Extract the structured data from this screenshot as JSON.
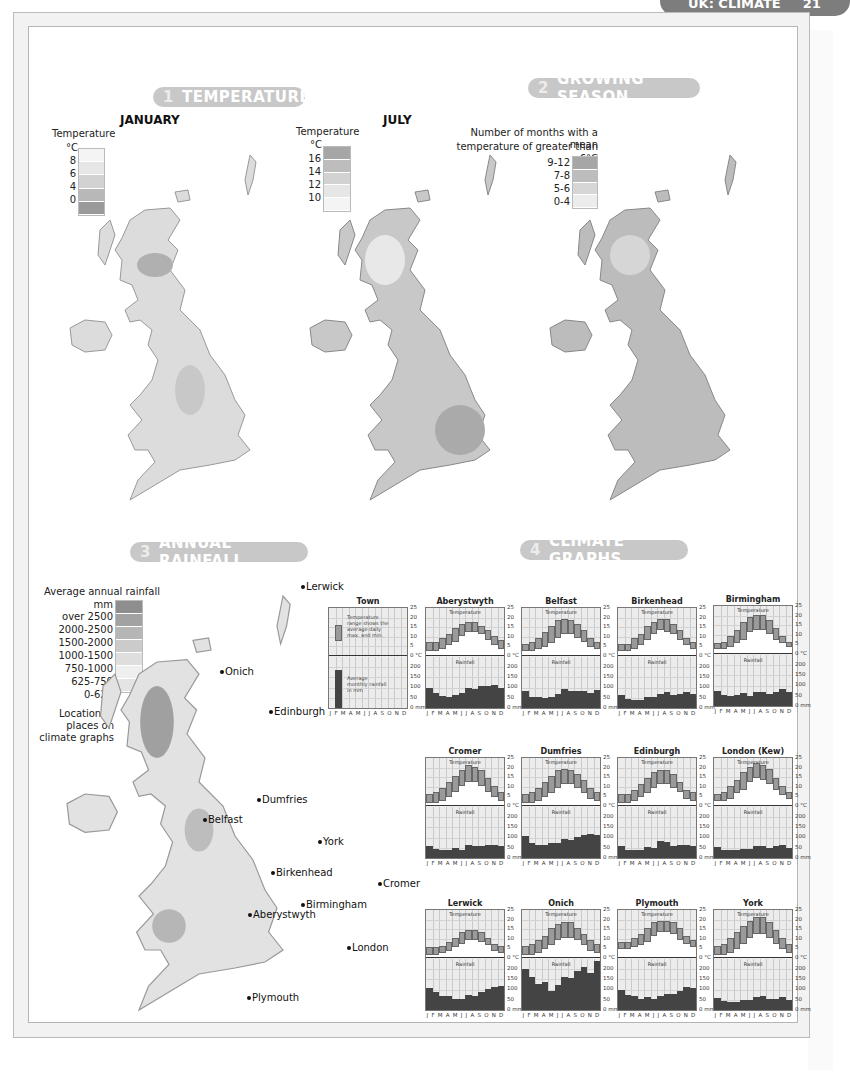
{
  "page_header": {
    "title": "UK: CLIMATE",
    "page_number": "21"
  },
  "sections": {
    "temperature": {
      "number": "1",
      "title": "TEMPERATURE"
    },
    "growing_season": {
      "number": "2",
      "title": "GROWING SEASON"
    },
    "annual_rainfall": {
      "number": "3",
      "title": "ANNUAL RAINFALL"
    },
    "climate_graphs": {
      "number": "4",
      "title": "CLIMATE GRAPHS"
    }
  },
  "january_map": {
    "title": "JANUARY",
    "legend": {
      "title": "Temperature",
      "unit": "°C",
      "ticks": [
        "8",
        "6",
        "4",
        "0"
      ],
      "colors": [
        "#f4f4f4",
        "#e6e6e6",
        "#d2d2d2",
        "#b8b8b8",
        "#9a9a9a"
      ]
    }
  },
  "july_map": {
    "title": "JULY",
    "legend": {
      "title": "Temperature",
      "unit": "°C",
      "ticks": [
        "16",
        "14",
        "12",
        "10"
      ],
      "colors": [
        "#a6a6a6",
        "#bdbdbd",
        "#d2d2d2",
        "#e6e6e6",
        "#f4f4f4"
      ]
    }
  },
  "growing_map": {
    "legend": {
      "title_line1": "Number of months with a mean",
      "title_line2": "temperature of greater than 6°C",
      "items": [
        "9-12",
        "7-8",
        "5-6",
        "0-4"
      ],
      "colors": [
        "#a6a6a6",
        "#bdbdbd",
        "#d6d6d6",
        "#ececec"
      ]
    }
  },
  "rainfall_map": {
    "legend": {
      "title": "Average annual rainfall",
      "unit": "mm",
      "items": [
        "over 2500",
        "2000-2500",
        "1500-2000",
        "1000-1500",
        "750-1000",
        "625-750",
        "0-625"
      ],
      "colors": [
        "#8e8e8e",
        "#a2a2a2",
        "#b6b6b6",
        "#cbcbcb",
        "#dedede",
        "#efefef",
        "#e4e4e4"
      ],
      "location_label_1": "Location of",
      "location_label_2": "places on",
      "location_label_3": "climate graphs"
    },
    "places": [
      {
        "name": "Lerwick",
        "x": 301,
        "y": 587
      },
      {
        "name": "Onich",
        "x": 220,
        "y": 672
      },
      {
        "name": "Edinburgh",
        "x": 269,
        "y": 712
      },
      {
        "name": "Dumfries",
        "x": 257,
        "y": 800
      },
      {
        "name": "Belfast",
        "x": 203,
        "y": 820
      },
      {
        "name": "York",
        "x": 318,
        "y": 842
      },
      {
        "name": "Birkenhead",
        "x": 271,
        "y": 873
      },
      {
        "name": "Cromer",
        "x": 378,
        "y": 884
      },
      {
        "name": "Birmingham",
        "x": 301,
        "y": 905
      },
      {
        "name": "Aberystwyth",
        "x": 248,
        "y": 915
      },
      {
        "name": "London",
        "x": 347,
        "y": 948
      },
      {
        "name": "Plymouth",
        "x": 247,
        "y": 998
      }
    ]
  },
  "climate_graphs": {
    "months": [
      "J",
      "F",
      "M",
      "A",
      "M",
      "J",
      "J",
      "A",
      "S",
      "O",
      "N",
      "D"
    ],
    "temp_axis": [
      "25",
      "20",
      "15",
      "10",
      "5",
      "0 °C"
    ],
    "rain_axis": [
      "200",
      "150",
      "100",
      "50",
      "0 mm"
    ],
    "temperature_label": "Temperature",
    "rainfall_label": "Rainfall",
    "key": {
      "title": "Town",
      "temp_text": "Temperature range shows the average daily max. and min.",
      "rain_text": "Average monthly rainfall in mm"
    }
  },
  "chart_data": [
    {
      "type": "bar",
      "title": "Aberystwyth",
      "categories": [
        "J",
        "F",
        "M",
        "A",
        "M",
        "J",
        "J",
        "A",
        "S",
        "O",
        "N",
        "D"
      ],
      "series": [
        {
          "name": "Max temperature (°C)",
          "values": [
            7,
            7,
            9,
            11,
            14,
            16,
            17,
            17,
            15,
            13,
            10,
            8
          ]
        },
        {
          "name": "Min temperature (°C)",
          "values": [
            2,
            2,
            3,
            5,
            7,
            10,
            12,
            12,
            11,
            8,
            5,
            3
          ]
        },
        {
          "name": "Rainfall (mm)",
          "values": [
            97,
            72,
            60,
            56,
            65,
            76,
            98,
            95,
            106,
            109,
            113,
            99
          ]
        }
      ]
    },
    {
      "type": "bar",
      "title": "Belfast",
      "categories": [
        "J",
        "F",
        "M",
        "A",
        "M",
        "J",
        "J",
        "A",
        "S",
        "O",
        "N",
        "D"
      ],
      "series": [
        {
          "name": "Max temperature (°C)",
          "values": [
            6,
            7,
            9,
            12,
            15,
            18,
            19,
            18,
            16,
            13,
            9,
            7
          ]
        },
        {
          "name": "Min temperature (°C)",
          "values": [
            2,
            2,
            3,
            4,
            6,
            9,
            11,
            11,
            9,
            7,
            4,
            3
          ]
        },
        {
          "name": "Rainfall (mm)",
          "values": [
            83,
            55,
            53,
            51,
            56,
            68,
            94,
            82,
            83,
            85,
            75,
            90
          ]
        }
      ]
    },
    {
      "type": "bar",
      "title": "Birkenhead",
      "categories": [
        "J",
        "F",
        "M",
        "A",
        "M",
        "J",
        "J",
        "A",
        "S",
        "O",
        "N",
        "D"
      ],
      "series": [
        {
          "name": "Max temperature (°C)",
          "values": [
            6,
            6,
            9,
            11,
            15,
            17,
            19,
            19,
            16,
            13,
            9,
            7
          ]
        },
        {
          "name": "Min temperature (°C)",
          "values": [
            2,
            2,
            3,
            5,
            8,
            11,
            13,
            12,
            11,
            8,
            5,
            3
          ]
        },
        {
          "name": "Rainfall (mm)",
          "values": [
            64,
            46,
            40,
            41,
            55,
            55,
            67,
            80,
            66,
            71,
            77,
            68
          ]
        }
      ]
    },
    {
      "type": "bar",
      "title": "Birmingham",
      "categories": [
        "J",
        "F",
        "M",
        "A",
        "M",
        "J",
        "J",
        "A",
        "S",
        "O",
        "N",
        "D"
      ],
      "series": [
        {
          "name": "Max temperature (°C)",
          "values": [
            5,
            6,
            9,
            12,
            16,
            19,
            20,
            20,
            17,
            13,
            9,
            6
          ]
        },
        {
          "name": "Min temperature (°C)",
          "values": [
            2,
            2,
            3,
            5,
            7,
            11,
            12,
            12,
            10,
            7,
            5,
            3
          ]
        },
        {
          "name": "Rainfall (mm)",
          "values": [
            74,
            54,
            50,
            53,
            64,
            50,
            69,
            69,
            61,
            69,
            84,
            67
          ]
        }
      ]
    },
    {
      "type": "bar",
      "title": "Cromer",
      "categories": [
        "J",
        "F",
        "M",
        "A",
        "M",
        "J",
        "J",
        "A",
        "S",
        "O",
        "N",
        "D"
      ],
      "series": [
        {
          "name": "Max temperature (°C)",
          "values": [
            6,
            7,
            9,
            12,
            15,
            18,
            21,
            20,
            18,
            14,
            10,
            7
          ]
        },
        {
          "name": "Min temperature (°C)",
          "values": [
            1,
            1,
            2,
            4,
            7,
            10,
            12,
            12,
            10,
            7,
            4,
            2
          ]
        },
        {
          "name": "Rainfall (mm)",
          "values": [
            58,
            46,
            37,
            37,
            48,
            39,
            63,
            58,
            58,
            63,
            66,
            58
          ]
        }
      ]
    },
    {
      "type": "bar",
      "title": "Dumfries",
      "categories": [
        "J",
        "F",
        "M",
        "A",
        "M",
        "J",
        "J",
        "A",
        "S",
        "O",
        "N",
        "D"
      ],
      "series": [
        {
          "name": "Max temperature (°C)",
          "values": [
            6,
            7,
            9,
            12,
            15,
            18,
            19,
            18,
            16,
            13,
            9,
            7
          ]
        },
        {
          "name": "Min temperature (°C)",
          "values": [
            1,
            1,
            2,
            4,
            6,
            9,
            11,
            11,
            9,
            6,
            3,
            2
          ]
        },
        {
          "name": "Rainfall (mm)",
          "values": [
            110,
            72,
            66,
            64,
            72,
            74,
            95,
            88,
            103,
            112,
            118,
            114
          ]
        }
      ]
    },
    {
      "type": "bar",
      "title": "Edinburgh",
      "categories": [
        "J",
        "F",
        "M",
        "A",
        "M",
        "J",
        "J",
        "A",
        "S",
        "O",
        "N",
        "D"
      ],
      "series": [
        {
          "name": "Max temperature (°C)",
          "values": [
            6,
            6,
            8,
            11,
            14,
            17,
            18,
            18,
            16,
            12,
            8,
            7
          ]
        },
        {
          "name": "Min temperature (°C)",
          "values": [
            1,
            1,
            2,
            4,
            6,
            9,
            11,
            11,
            9,
            7,
            3,
            2
          ]
        },
        {
          "name": "Rainfall (mm)",
          "values": [
            57,
            39,
            39,
            39,
            54,
            47,
            83,
            77,
            57,
            65,
            63,
            58
          ]
        }
      ]
    },
    {
      "type": "bar",
      "title": "London (Kew)",
      "categories": [
        "J",
        "F",
        "M",
        "A",
        "M",
        "J",
        "J",
        "A",
        "S",
        "O",
        "N",
        "D"
      ],
      "series": [
        {
          "name": "Max temperature (°C)",
          "values": [
            6,
            7,
            10,
            13,
            17,
            20,
            22,
            21,
            19,
            14,
            10,
            7
          ]
        },
        {
          "name": "Min temperature (°C)",
          "values": [
            2,
            2,
            3,
            6,
            8,
            12,
            14,
            13,
            11,
            8,
            5,
            3
          ]
        },
        {
          "name": "Rainfall (mm)",
          "values": [
            54,
            40,
            37,
            37,
            46,
            45,
            57,
            59,
            49,
            57,
            64,
            48
          ]
        }
      ]
    },
    {
      "type": "bar",
      "title": "Lerwick",
      "categories": [
        "J",
        "F",
        "M",
        "A",
        "M",
        "J",
        "J",
        "A",
        "S",
        "O",
        "N",
        "D"
      ],
      "series": [
        {
          "name": "Max temperature (°C)",
          "values": [
            5,
            5,
            6,
            8,
            10,
            13,
            14,
            14,
            13,
            10,
            7,
            6
          ]
        },
        {
          "name": "Min temperature (°C)",
          "values": [
            1,
            1,
            2,
            3,
            5,
            7,
            9,
            9,
            8,
            6,
            3,
            2
          ]
        },
        {
          "name": "Rainfall (mm)",
          "values": [
            109,
            87,
            69,
            68,
            52,
            55,
            72,
            71,
            87,
            104,
            111,
            118
          ]
        }
      ]
    },
    {
      "type": "bar",
      "title": "Onich",
      "categories": [
        "J",
        "F",
        "M",
        "A",
        "M",
        "J",
        "J",
        "A",
        "S",
        "O",
        "N",
        "D"
      ],
      "series": [
        {
          "name": "Max temperature (°C)",
          "values": [
            6,
            7,
            9,
            11,
            15,
            17,
            18,
            18,
            15,
            12,
            9,
            7
          ]
        },
        {
          "name": "Min temperature (°C)",
          "values": [
            1,
            1,
            2,
            4,
            6,
            9,
            10,
            10,
            9,
            6,
            3,
            2
          ]
        },
        {
          "name": "Rainfall (mm)",
          "values": [
            200,
            164,
            128,
            135,
            95,
            125,
            162,
            157,
            190,
            212,
            183,
            238
          ]
        }
      ]
    },
    {
      "type": "bar",
      "title": "Plymouth",
      "categories": [
        "J",
        "F",
        "M",
        "A",
        "M",
        "J",
        "J",
        "A",
        "S",
        "O",
        "N",
        "D"
      ],
      "series": [
        {
          "name": "Max temperature (°C)",
          "values": [
            8,
            8,
            10,
            12,
            15,
            18,
            19,
            19,
            18,
            15,
            11,
            9
          ]
        },
        {
          "name": "Min temperature (°C)",
          "values": [
            4,
            4,
            5,
            6,
            8,
            11,
            13,
            13,
            12,
            9,
            7,
            5
          ]
        },
        {
          "name": "Rainfall (mm)",
          "values": [
            99,
            74,
            69,
            53,
            63,
            53,
            70,
            77,
            78,
            91,
            113,
            110
          ]
        }
      ]
    },
    {
      "type": "bar",
      "title": "York",
      "categories": [
        "J",
        "F",
        "M",
        "A",
        "M",
        "J",
        "J",
        "A",
        "S",
        "O",
        "N",
        "D"
      ],
      "series": [
        {
          "name": "Max temperature (°C)",
          "values": [
            6,
            7,
            10,
            13,
            16,
            19,
            21,
            21,
            18,
            14,
            10,
            7
          ]
        },
        {
          "name": "Min temperature (°C)",
          "values": [
            1,
            1,
            2,
            4,
            7,
            10,
            12,
            12,
            10,
            7,
            4,
            2
          ]
        },
        {
          "name": "Rainfall (mm)",
          "values": [
            59,
            46,
            37,
            41,
            50,
            50,
            62,
            68,
            55,
            56,
            65,
            50
          ]
        }
      ]
    }
  ]
}
